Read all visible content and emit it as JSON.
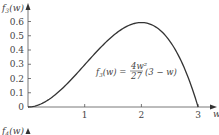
{
  "chart_data": {
    "type": "line",
    "title": "",
    "xlabel": "w",
    "ylabel": "f3(w)",
    "ylabel_parts": {
      "base": "f",
      "sub": "3",
      "arg": "(w)"
    },
    "xlim": [
      0,
      3.3
    ],
    "ylim": [
      0,
      0.7
    ],
    "xticks": [
      1,
      2,
      3
    ],
    "xtick_labels": [
      "1",
      "2",
      "3"
    ],
    "yticks": [
      0,
      0.1,
      0.2,
      0.3,
      0.4,
      0.5,
      0.6
    ],
    "ytick_labels": [
      "0",
      "0.1",
      "0.2",
      "0.3",
      "0.4",
      "0.5",
      "0.6"
    ],
    "grid": false,
    "series": [
      {
        "name": "f3(w) = 4w^2/27 (3 - w)",
        "x": [
          0,
          0.25,
          0.5,
          0.75,
          1,
          1.25,
          1.5,
          1.75,
          2,
          2.25,
          2.5,
          2.75,
          3
        ],
        "y": [
          0,
          0.023,
          0.093,
          0.188,
          0.296,
          0.405,
          0.5,
          0.567,
          0.593,
          0.563,
          0.463,
          0.28,
          0
        ]
      }
    ],
    "annotation": {
      "lhs": "f3(w) =",
      "numerator": "4w²",
      "denominator": "27",
      "rhs": "(3 − w)"
    },
    "next_panel_label": "f4(w)"
  }
}
